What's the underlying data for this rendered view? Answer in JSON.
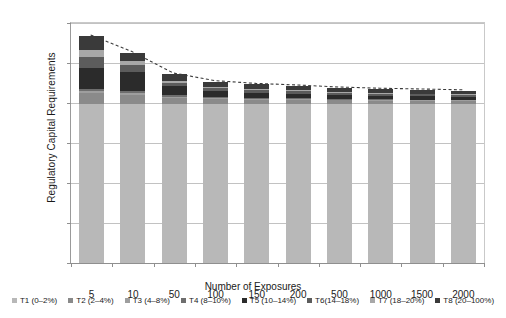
{
  "chart_data": {
    "type": "bar",
    "subtype": "stacked-bar-with-trendline",
    "title": "",
    "xlabel": "Number of Exposures",
    "ylabel": "Regulatory Capital Requirements",
    "categories": [
      "5",
      "10",
      "50",
      "100",
      "150",
      "200",
      "500",
      "1000",
      "1500",
      "2000"
    ],
    "ylim": [
      0,
      12
    ],
    "yticks": [
      "0%",
      "2%",
      "4%",
      "6%",
      "8%",
      "10%",
      "12%"
    ],
    "ytick_values": [
      0,
      2,
      4,
      6,
      8,
      10,
      12
    ],
    "y_unit": "%",
    "grid": true,
    "legend_position": "bottom",
    "series": [
      {
        "name": "T1 (0–2%)",
        "color": "#b8b8b8",
        "values": [
          7.95,
          7.95,
          7.95,
          7.95,
          7.95,
          7.95,
          7.95,
          7.95,
          7.95,
          7.95
        ]
      },
      {
        "name": "T2 (2–4%)",
        "color": "#8a8a8a",
        "values": [
          0.55,
          0.45,
          0.3,
          0.25,
          0.22,
          0.2,
          0.18,
          0.17,
          0.16,
          0.15
        ]
      },
      {
        "name": "T3 (4–8%)",
        "color": "#9e9e9e",
        "values": [
          0.1,
          0.08,
          0.06,
          0.05,
          0.04,
          0.04,
          0.03,
          0.03,
          0.03,
          0.03
        ]
      },
      {
        "name": "T4 (8–10%)",
        "color": "#6e6e6e",
        "values": [
          0.12,
          0.1,
          0.07,
          0.05,
          0.05,
          0.04,
          0.04,
          0.03,
          0.03,
          0.03
        ]
      },
      {
        "name": "T5 (10–14%)",
        "color": "#2b2b2b",
        "values": [
          1.05,
          0.95,
          0.45,
          0.3,
          0.26,
          0.24,
          0.2,
          0.18,
          0.17,
          0.16
        ]
      },
      {
        "name": "T6(14–18%)",
        "color": "#5c5c5c",
        "values": [
          0.55,
          0.35,
          0.18,
          0.14,
          0.12,
          0.11,
          0.1,
          0.09,
          0.09,
          0.08
        ]
      },
      {
        "name": "T7 (18–20%)",
        "color": "#a8a8a8",
        "values": [
          0.35,
          0.22,
          0.1,
          0.07,
          0.06,
          0.06,
          0.05,
          0.05,
          0.04,
          0.04
        ]
      },
      {
        "name": "T8 (20–100%)",
        "color": "#3a3a3a",
        "values": [
          0.68,
          0.42,
          0.34,
          0.26,
          0.23,
          0.21,
          0.2,
          0.19,
          0.18,
          0.17
        ]
      }
    ],
    "totals": [
      11.35,
      10.52,
      9.45,
      9.07,
      8.93,
      8.85,
      8.75,
      8.69,
      8.65,
      8.61
    ],
    "trendline": {
      "name": "total-trend",
      "style": "dashed",
      "color": "#3a3a3a",
      "values": [
        11.35,
        10.52,
        9.45,
        9.07,
        8.93,
        8.85,
        8.75,
        8.69,
        8.65,
        8.61
      ]
    }
  },
  "axes": {
    "y_title": "Regulatory Capital Requirements",
    "x_title": "Number of Exposures"
  }
}
